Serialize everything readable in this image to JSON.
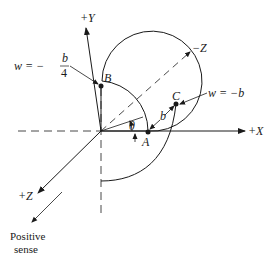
{
  "diagram": {
    "axes": {
      "x_pos": "+X",
      "y_pos": "+Y",
      "z_pos": "+Z",
      "z_neg": "−Z"
    },
    "points": {
      "a": "A",
      "b": "B",
      "c": "C"
    },
    "labels": {
      "theta": "θ",
      "b_dist": "b",
      "w_eq_prefix": "w = −",
      "w_b_num": "b",
      "w_b_den": "4",
      "w_c": "w = −b",
      "positive_line1": "Positive",
      "positive_line2": "sense"
    },
    "colors": {
      "ink": "#1a1a1a",
      "background": "#ffffff"
    }
  }
}
